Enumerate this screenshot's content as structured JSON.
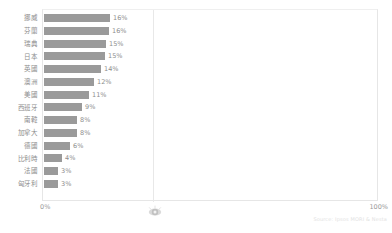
{
  "header": {
    "fragments": [
      "",
      ""
    ]
  },
  "axis": {
    "min_label": "0%",
    "max_label": "100%"
  },
  "footer": {
    "source": "Source: Ipsos MORI & Nesta"
  },
  "icons": {
    "cursor": "cursor-icon"
  },
  "colors": {
    "bar": "#9a9a9a",
    "text": "#8d8d8d",
    "gridline": "#e8e8e8",
    "frame": "#e6e6e6"
  },
  "chart_data": {
    "type": "bar",
    "orientation": "horizontal",
    "title": "",
    "xlabel": "",
    "ylabel": "",
    "xlim": [
      0,
      100
    ],
    "grid": true,
    "legend": null,
    "categories": [
      "挪威",
      "芬蘭",
      "瑞典",
      "日本",
      "英國",
      "澳洲",
      "美國",
      "西班牙",
      "南韓",
      "加拿大",
      "德國",
      "比利時",
      "法國",
      "匈牙利"
    ],
    "values": [
      16,
      16,
      15,
      15,
      14,
      12,
      11,
      9,
      8,
      8,
      6,
      4,
      3,
      3
    ],
    "value_labels": [
      "16%",
      "16%",
      "15%",
      "15%",
      "14%",
      "12%",
      "11%",
      "9%",
      "8%",
      "8%",
      "6%",
      "4%",
      "3%",
      "3%"
    ],
    "bar_pixel_widths": [
      66,
      65,
      62,
      61,
      57,
      50,
      45,
      38,
      33,
      33,
      26,
      18,
      14,
      14
    ]
  }
}
